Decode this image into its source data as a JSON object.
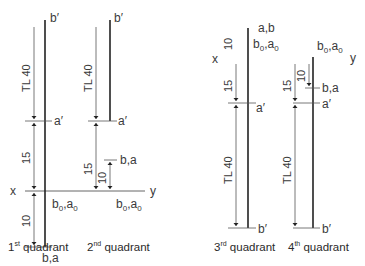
{
  "figure": {
    "colors": {
      "line": "#222222",
      "dimension": "#555555",
      "text": "#3a3a3a"
    }
  },
  "axis": {
    "x_label": "x",
    "y_label": "y"
  },
  "quadrants": [
    {
      "caption_num": "1",
      "caption_sup": "st",
      "caption_text": " quadrant",
      "top_label": "b′",
      "a_prime_label": "a′",
      "ground_label": "b₀,a₀",
      "bottom_label": "b,a",
      "tl_label": "TL 40",
      "dim_15": "15",
      "dim_10": "10"
    },
    {
      "caption_num": "2",
      "caption_sup": "nd",
      "caption_text": " quadrant",
      "top_label": "b′",
      "a_prime_label": "a′",
      "ground_label": "b₀,a₀",
      "ba_label": "b,a",
      "tl_label": "TL 40",
      "dim_15": "15",
      "dim_10": "10"
    },
    {
      "caption_num": "3",
      "caption_sup": "rd",
      "caption_text": " quadrant",
      "top_label": "a,b",
      "ground_label": "b₀,a₀",
      "a_prime_label": "a′",
      "bottom_label": "b′",
      "tl_label": "TL 40",
      "dim_15": "15",
      "dim_10": "10"
    },
    {
      "caption_num": "4",
      "caption_sup": "th",
      "caption_text": " quadrant",
      "ground_label": "b₀,a₀",
      "ba_label": "b,a",
      "a_prime_label": "a′",
      "bottom_label": "b′",
      "tl_label": "TL 40",
      "dim_15": "15",
      "dim_10": "10"
    }
  ]
}
